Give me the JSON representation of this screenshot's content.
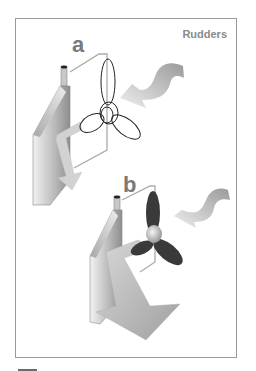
{
  "figure": {
    "title": "Rudders",
    "panels": [
      {
        "label": "a",
        "description": "Rudder with unshaded propeller outline; water flow arrow curving in from right, deflected downward by rudder"
      },
      {
        "label": "b",
        "description": "Rudder turned with dark shaded propeller; large deflected flow arrow pushing down-right"
      }
    ]
  },
  "colors": {
    "frame": "#9a9a9a",
    "title": "#8a8a8a",
    "label": "#7a7a7a",
    "rudder_light": "#e6e6e6",
    "rudder_dark": "#9c9c9c",
    "propeller_dark": "#3a3a3a",
    "arrow": "#c8c8c8"
  }
}
